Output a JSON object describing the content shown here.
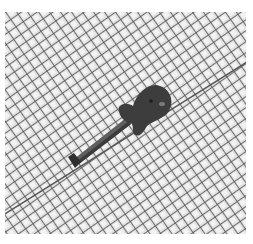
{
  "image": {
    "description": "Grayscale photo of an electric guitar lying diagonally on a wire mesh grid",
    "subject": "electric-guitar",
    "background": "diagonal-wire-mesh",
    "colors": {
      "background_fill": "#e6e6e6",
      "mesh_line": "#4a4a4a",
      "mesh_highlight": "#f4f4f4",
      "guitar_body": "#3c3c3c",
      "guitar_neck": "#5a5a5a",
      "border": "#ffffff"
    }
  }
}
